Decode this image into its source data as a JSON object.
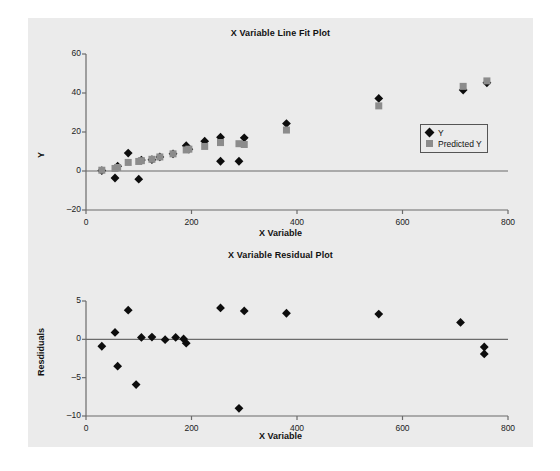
{
  "page": {
    "background": "#ebebeb",
    "canvas_background": "#ffffff"
  },
  "colors": {
    "series_y": "#0d0d0d",
    "series_predicted": "#8c8c8c",
    "axis": "#6b6b6b",
    "text": "#111111"
  },
  "legend": {
    "position": "right-middle",
    "entries": [
      {
        "label": "Y",
        "marker": "diamond",
        "color": "#0d0d0d",
        "icon": "diamond-marker-icon"
      },
      {
        "label": "Predicted Y",
        "marker": "square",
        "color": "#8c8c8c",
        "icon": "square-marker-icon"
      }
    ]
  },
  "chart_data": [
    {
      "id": "line-fit-plot",
      "type": "scatter",
      "title": "X Variable Line Fit Plot",
      "xlabel": "X Variable",
      "ylabel": "Y",
      "xlim": [
        0,
        800
      ],
      "ylim": [
        -20,
        60
      ],
      "xticks": [
        0,
        200,
        400,
        600,
        800
      ],
      "yticks": [
        -20,
        0,
        20,
        40,
        60
      ],
      "xtick_labels": [
        "0",
        "200",
        "400",
        "600",
        "800"
      ],
      "ytick_labels": [
        "-20",
        "0",
        "20",
        "40",
        "60"
      ],
      "grid": false,
      "x": [
        30,
        55,
        60,
        80,
        100,
        105,
        125,
        140,
        165,
        190,
        195,
        225,
        255,
        255,
        290,
        300,
        380,
        555,
        715,
        760
      ],
      "series": [
        {
          "name": "Y",
          "marker": "diamond",
          "color": "#0d0d0d",
          "values": [
            0.2,
            -3.6,
            2.5,
            9.2,
            -4.2,
            5.6,
            5.8,
            7.2,
            8.8,
            13.0,
            11.2,
            15.3,
            17.3,
            5.0,
            5.0,
            17.0,
            24.3,
            37.2,
            41.5,
            45.2
          ]
        },
        {
          "name": "Predicted Y",
          "marker": "square",
          "color": "#8c8c8c",
          "values": [
            0.4,
            1.3,
            1.8,
            4.4,
            4.9,
            5.3,
            6.0,
            7.2,
            8.8,
            10.8,
            11.2,
            12.6,
            14.6,
            14.6,
            14.0,
            13.6,
            21.0,
            33.4,
            43.4,
            46.2
          ]
        }
      ]
    },
    {
      "id": "residual-plot",
      "type": "scatter",
      "title": "X Variable Residual Plot",
      "xlabel": "X Variable",
      "ylabel": "Resdiduals",
      "xlim": [
        0,
        800
      ],
      "ylim": [
        -10,
        5
      ],
      "xticks": [
        0,
        200,
        400,
        600,
        800
      ],
      "yticks": [
        -10,
        -5,
        0,
        5
      ],
      "xtick_labels": [
        "0",
        "200",
        "400",
        "600",
        "800"
      ],
      "ytick_labels": [
        "-10",
        "-5",
        "0",
        "5"
      ],
      "grid": false,
      "x": [
        30,
        55,
        60,
        80,
        95,
        105,
        125,
        150,
        170,
        185,
        190,
        255,
        290,
        300,
        380,
        555,
        710,
        755
      ],
      "series": [
        {
          "name": "Residuals",
          "marker": "diamond",
          "color": "#0d0d0d",
          "values": [
            -0.9,
            0.9,
            -3.5,
            3.8,
            -5.9,
            0.25,
            0.3,
            -0.05,
            0.25,
            0.05,
            -0.5,
            4.1,
            -9.0,
            3.7,
            3.4,
            3.3,
            2.2,
            -1.9
          ]
        }
      ]
    }
  ],
  "residual_extra": {
    "x": 755,
    "value": -1.0
  }
}
